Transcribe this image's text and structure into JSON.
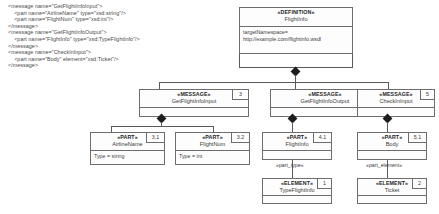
{
  "code_block": {
    "lines": [
      "<message name=\"GetFlightInfoInput\">",
      "    <part name=\"AirlineName\" type=\"xsd:string\"/>",
      "    <part name=\"FlightNum\" type=\"xsd:int\"/>",
      "</message>",
      "<message name=\"GetFlightInfoOutput\">",
      "    <part name=\"FlightInfo\" type=\"xsd:TypeFlightInfo\"/>",
      "</message>",
      "<message name=\"CheckInInput\">",
      "    <part name=\"Body\" element=\"xsd:Ticket\"/>",
      "</message>"
    ],
    "text": "<message name=\"GetFlightInfoInput\">\n    <part name=\"AirlineName\" type=\"xsd:string\"/>\n    <part name=\"FlightNum\" type=\"xsd:int\"/>\n</message>\n<message name=\"GetFlightInfoOutput\">\n    <part name=\"FlightInfo\" type=\"xsd:TypeFlightInfo\"/>\n</message>\n<message name=\"CheckInInput\">\n    <part name=\"Body\" element=\"xsd:Ticket\"/>\n</message>"
  },
  "diagram": {
    "definition": {
      "stereotype": "«DEFINITION»",
      "name": "FlightInfo",
      "attr_line1": "targetNamespace=",
      "attr_line2": "http://example.com/flightinfo.wsdl"
    },
    "messages": [
      {
        "stereotype": "«MESSAGE»",
        "name": "GetFlightInfoInput",
        "tag": "3"
      },
      {
        "stereotype": "«MESSAGE»",
        "name": "GetFlightInfoOutput",
        "tag": "4"
      },
      {
        "stereotype": "«MESSAGE»",
        "name": "CheckInInput",
        "tag": "5"
      }
    ],
    "parts": [
      {
        "stereotype": "«PART»",
        "name": "AirlineName",
        "tag": "3.1",
        "attr": "Type = string"
      },
      {
        "stereotype": "«PART»",
        "name": "FlightNum",
        "tag": "3.2",
        "attr": "Type = int"
      },
      {
        "stereotype": "«PART»",
        "name": "FlightInfo",
        "tag": "4.1",
        "attr": ""
      },
      {
        "stereotype": "«PART»",
        "name": "Body",
        "tag": "5.1",
        "attr": ""
      }
    ],
    "elements": [
      {
        "stereotype": "«ELEMENT»",
        "name": "TypeFlightInfo",
        "tag": "1"
      },
      {
        "stereotype": "«ELEMENT»",
        "name": "Ticket",
        "tag": "2"
      }
    ],
    "edge_labels": {
      "part_type": "«part_type»",
      "part_element": "«part_element»"
    },
    "colors": {
      "line": "#5a5a5a",
      "border": "#6d6d6d",
      "fill": "#fdfdfd",
      "diamond": "#1e1e1e",
      "text": "#3a3a3a",
      "background": "#ffffff"
    }
  }
}
